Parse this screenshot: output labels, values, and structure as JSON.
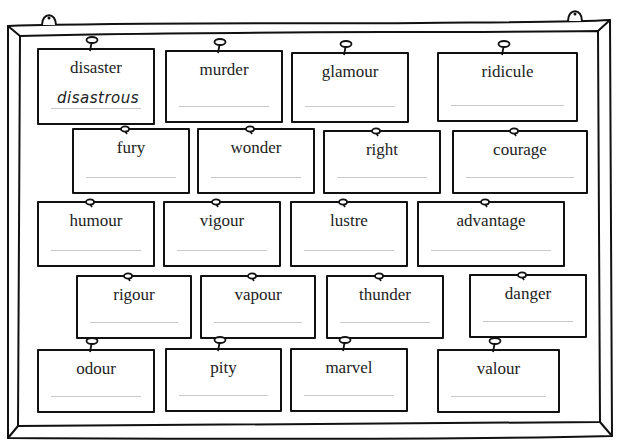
{
  "board": {
    "frame_color": "#111111",
    "answer_line_color": "#c8c8c8"
  },
  "cards": [
    {
      "word": "disaster",
      "answer": "disastrous",
      "x": 37,
      "y": 48,
      "w": 118,
      "h": 77,
      "pin": "stem"
    },
    {
      "word": "murder",
      "answer": "",
      "x": 165,
      "y": 50,
      "w": 118,
      "h": 73,
      "pin": "stem"
    },
    {
      "word": "glamour",
      "answer": "",
      "x": 291,
      "y": 52,
      "w": 118,
      "h": 71,
      "pin": "stem"
    },
    {
      "word": "ridicule",
      "answer": "",
      "x": 437,
      "y": 52,
      "w": 141,
      "h": 70,
      "pin": "stem"
    },
    {
      "word": "fury",
      "answer": "",
      "x": 72,
      "y": 128,
      "w": 118,
      "h": 66,
      "pin": "small"
    },
    {
      "word": "wonder",
      "answer": "",
      "x": 197,
      "y": 128,
      "w": 118,
      "h": 66,
      "pin": "small"
    },
    {
      "word": "right",
      "answer": "",
      "x": 323,
      "y": 130,
      "w": 118,
      "h": 64,
      "pin": "small"
    },
    {
      "word": "courage",
      "answer": "",
      "x": 452,
      "y": 130,
      "w": 136,
      "h": 64,
      "pin": "small"
    },
    {
      "word": "humour",
      "answer": "",
      "x": 37,
      "y": 201,
      "w": 118,
      "h": 66,
      "pin": "small"
    },
    {
      "word": "vigour",
      "answer": "",
      "x": 163,
      "y": 201,
      "w": 118,
      "h": 66,
      "pin": "small"
    },
    {
      "word": "lustre",
      "answer": "",
      "x": 290,
      "y": 201,
      "w": 118,
      "h": 66,
      "pin": "small"
    },
    {
      "word": "advantage",
      "answer": "",
      "x": 417,
      "y": 201,
      "w": 148,
      "h": 66,
      "pin": "small"
    },
    {
      "word": "rigour",
      "answer": "",
      "x": 76,
      "y": 275,
      "w": 116,
      "h": 64,
      "pin": "small"
    },
    {
      "word": "vapour",
      "answer": "",
      "x": 200,
      "y": 275,
      "w": 116,
      "h": 64,
      "pin": "small"
    },
    {
      "word": "thunder",
      "answer": "",
      "x": 326,
      "y": 275,
      "w": 118,
      "h": 64,
      "pin": "small"
    },
    {
      "word": "danger",
      "answer": "",
      "x": 469,
      "y": 274,
      "w": 118,
      "h": 64,
      "pin": "small"
    },
    {
      "word": "odour",
      "answer": "",
      "x": 37,
      "y": 349,
      "w": 118,
      "h": 64,
      "pin": "stem"
    },
    {
      "word": "pity",
      "answer": "",
      "x": 165,
      "y": 348,
      "w": 117,
      "h": 64,
      "pin": "stem"
    },
    {
      "word": "marvel",
      "answer": "",
      "x": 290,
      "y": 348,
      "w": 118,
      "h": 64,
      "pin": "stem"
    },
    {
      "word": "valour",
      "answer": "",
      "x": 437,
      "y": 349,
      "w": 123,
      "h": 64,
      "pin": "stem"
    }
  ]
}
